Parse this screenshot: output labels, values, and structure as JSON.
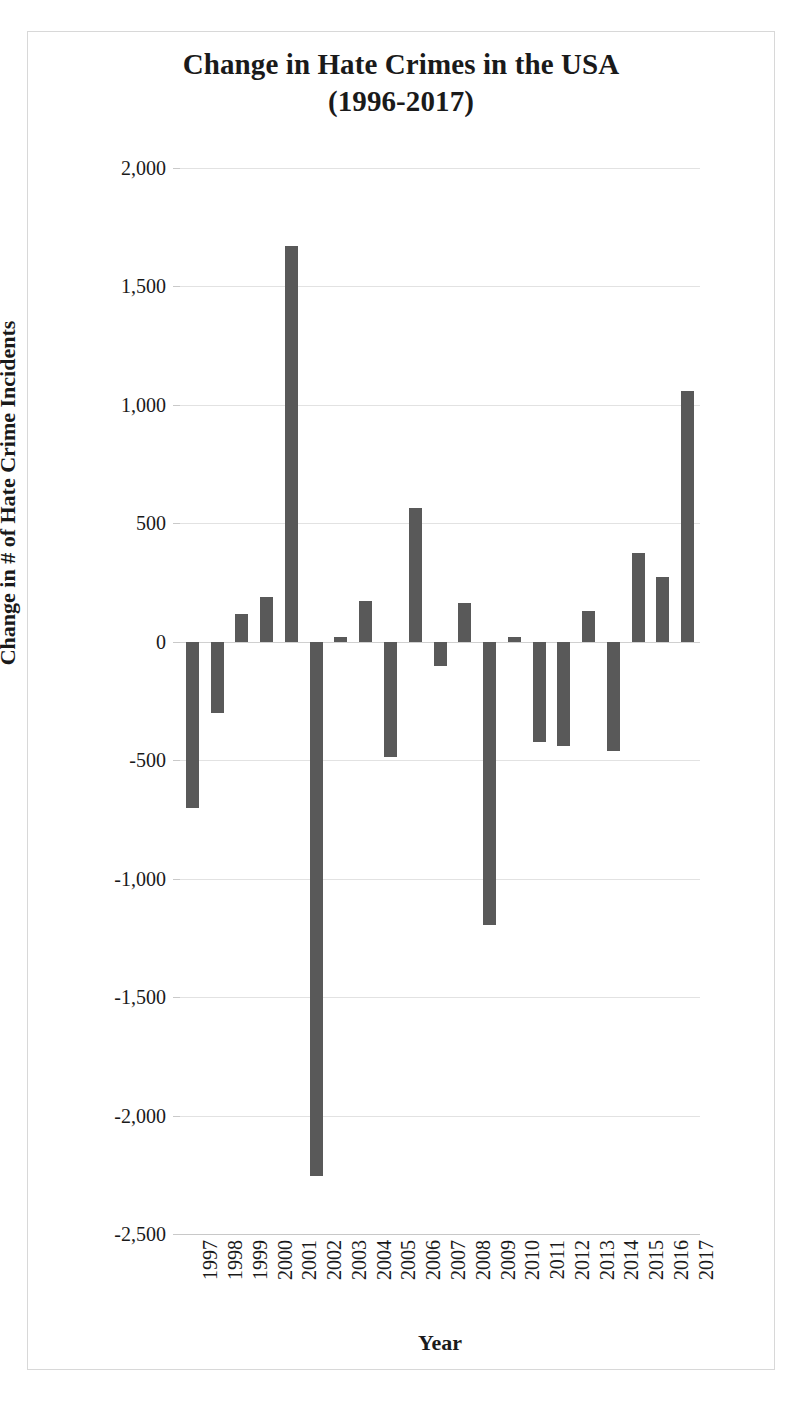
{
  "chart_data": {
    "type": "bar",
    "title": "Change in Hate Crimes in the USA\n(1996-2017)",
    "title_line1": "Change in Hate Crimes in the USA",
    "title_line2": "(1996-2017)",
    "xlabel": "Year",
    "ylabel": "Change in # of Hate Crime Incidents",
    "ylim": [
      -2500,
      2000
    ],
    "ytick_labels": [
      "2,000",
      "1,500",
      "1,000",
      "500",
      "0",
      "-500",
      "-1,000",
      "-1,500",
      "-2,000",
      "-2,500"
    ],
    "ytick_values": [
      2000,
      1500,
      1000,
      500,
      0,
      -500,
      -1000,
      -1500,
      -2000,
      -2500
    ],
    "grid": true,
    "legend": false,
    "bar_color": "#595959",
    "categories": [
      "1997",
      "1998",
      "1999",
      "2000",
      "2001",
      "2002",
      "2003",
      "2004",
      "2005",
      "2006",
      "2007",
      "2008",
      "2009",
      "2010",
      "2011",
      "2012",
      "2013",
      "2014",
      "2015",
      "2016",
      "2017"
    ],
    "values": [
      -700,
      -300,
      118,
      190,
      1670,
      -2255,
      20,
      172,
      -485,
      563,
      -102,
      162,
      -1195,
      20,
      -425,
      -440,
      132,
      -462,
      373,
      275,
      1060
    ]
  }
}
